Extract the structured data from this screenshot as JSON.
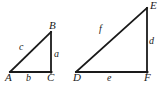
{
  "figure": {
    "stroke_color": "#1a1a1a",
    "background_color": "#ffffff",
    "triangles": [
      {
        "name": "triangle-abc",
        "vertices": [
          {
            "label": "A",
            "x": 10,
            "y": 72
          },
          {
            "label": "B",
            "x": 51,
            "y": 32
          },
          {
            "label": "C",
            "x": 51,
            "y": 72
          }
        ],
        "sides": [
          {
            "label": "a",
            "between": "B-C",
            "role": "vertical-leg"
          },
          {
            "label": "b",
            "between": "A-C",
            "role": "horizontal-leg"
          },
          {
            "label": "c",
            "between": "A-B",
            "role": "hypotenuse"
          }
        ]
      },
      {
        "name": "triangle-def",
        "vertices": [
          {
            "label": "D",
            "x": 76,
            "y": 72
          },
          {
            "label": "E",
            "x": 147,
            "y": 8
          },
          {
            "label": "F",
            "x": 147,
            "y": 72
          }
        ],
        "sides": [
          {
            "label": "d",
            "between": "E-F",
            "role": "vertical-leg"
          },
          {
            "label": "e",
            "between": "D-F",
            "role": "horizontal-leg"
          },
          {
            "label": "f",
            "between": "D-E",
            "role": "hypotenuse"
          }
        ]
      }
    ],
    "labels": {
      "A": "A",
      "B": "B",
      "C": "C",
      "a": "a",
      "b": "b",
      "c": "c",
      "D": "D",
      "E": "E",
      "F": "F",
      "d": "d",
      "e": "e",
      "f": "f"
    }
  }
}
